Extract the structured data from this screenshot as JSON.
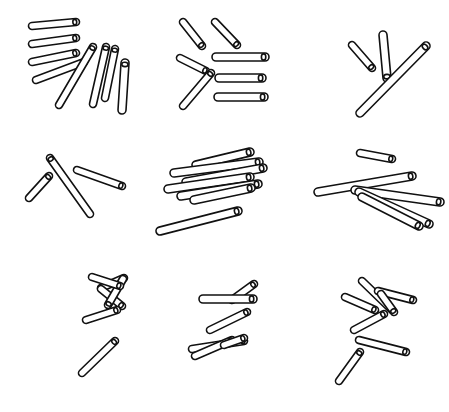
{
  "figure": {
    "width": 449,
    "height": 412,
    "background_color": "#ffffff",
    "stroke_color": "#111111",
    "fill_color": "#ffffff",
    "stroke_width": 1.6,
    "rows": 3,
    "columns": 3,
    "panel_count": 9,
    "panel_width": 149.67,
    "panel_height": 137.33,
    "style": "black outline stick / rod shapes with rounded end caps on plain white background"
  },
  "panels": [
    {
      "id": "panel-1",
      "position": "top-left",
      "row": 1,
      "col": 1,
      "stick_count": 8,
      "description": "Fan of four short near-horizontal sticks upper-left plus four long sticks angled down-right",
      "sticks": [
        {
          "name": "stick-1",
          "x1": 32,
          "y1": 26,
          "x2": 76,
          "y2": 22,
          "w": 7
        },
        {
          "name": "stick-2",
          "x1": 32,
          "y1": 44,
          "x2": 76,
          "y2": 38,
          "w": 7
        },
        {
          "name": "stick-3",
          "x1": 32,
          "y1": 62,
          "x2": 76,
          "y2": 53,
          "w": 7
        },
        {
          "name": "stick-4",
          "x1": 36,
          "y1": 80,
          "x2": 84,
          "y2": 62,
          "w": 7
        },
        {
          "name": "stick-5",
          "x1": 59,
          "y1": 105,
          "x2": 93,
          "y2": 47,
          "w": 7
        },
        {
          "name": "stick-6",
          "x1": 93,
          "y1": 104,
          "x2": 106,
          "y2": 47,
          "w": 7
        },
        {
          "name": "stick-7",
          "x1": 105,
          "y1": 98,
          "x2": 115,
          "y2": 49,
          "w": 7
        },
        {
          "name": "stick-8",
          "x1": 122,
          "y1": 110,
          "x2": 125,
          "y2": 63,
          "w": 8
        }
      ]
    },
    {
      "id": "panel-2",
      "position": "top-center",
      "row": 1,
      "col": 2,
      "stick_count": 7,
      "description": "Four diagonal sticks on the left and three thick horizontal sticks stacked on the right",
      "sticks": [
        {
          "name": "stick-1",
          "x1": 183,
          "y1": 22,
          "x2": 202,
          "y2": 46,
          "w": 7
        },
        {
          "name": "stick-2",
          "x1": 215,
          "y1": 22,
          "x2": 237,
          "y2": 45,
          "w": 7
        },
        {
          "name": "stick-3",
          "x1": 180,
          "y1": 58,
          "x2": 206,
          "y2": 71,
          "w": 7
        },
        {
          "name": "stick-4",
          "x1": 183,
          "y1": 106,
          "x2": 211,
          "y2": 73,
          "w": 7
        },
        {
          "name": "stick-5",
          "x1": 216,
          "y1": 57,
          "x2": 265,
          "y2": 57,
          "w": 8
        },
        {
          "name": "stick-6",
          "x1": 219,
          "y1": 78,
          "x2": 262,
          "y2": 78,
          "w": 8
        },
        {
          "name": "stick-7",
          "x1": 218,
          "y1": 97,
          "x2": 264,
          "y2": 97,
          "w": 8
        }
      ]
    },
    {
      "id": "panel-3",
      "position": "top-right",
      "row": 1,
      "col": 3,
      "stick_count": 3,
      "description": "Short diagonal stick, one steep vertical stick, and a long diagonal stick crossing lower-right",
      "sticks": [
        {
          "name": "stick-1",
          "x1": 352,
          "y1": 45,
          "x2": 372,
          "y2": 68,
          "w": 7
        },
        {
          "name": "stick-2",
          "x1": 383,
          "y1": 35,
          "x2": 387,
          "y2": 78,
          "w": 8
        },
        {
          "name": "stick-3",
          "x1": 360,
          "y1": 113,
          "x2": 426,
          "y2": 46,
          "w": 8
        }
      ]
    },
    {
      "id": "panel-4",
      "position": "middle-left",
      "row": 2,
      "col": 1,
      "stick_count": 3,
      "description": "One short diagonal stick lower-left, one long steep stick in the middle, one long shallow stick upper-right",
      "sticks": [
        {
          "name": "stick-1",
          "x1": 29,
          "y1": 198,
          "x2": 49,
          "y2": 176,
          "w": 7
        },
        {
          "name": "stick-2",
          "x1": 90,
          "y1": 214,
          "x2": 50,
          "y2": 158,
          "w": 7
        },
        {
          "name": "stick-3",
          "x1": 77,
          "y1": 170,
          "x2": 122,
          "y2": 186,
          "w": 7
        }
      ]
    },
    {
      "id": "panel-5",
      "position": "middle-center",
      "row": 2,
      "col": 2,
      "stick_count": 7,
      "description": "Dense overlapping cluster of six sticks plus one long stick below",
      "sticks": [
        {
          "name": "stick-1",
          "x1": 196,
          "y1": 165,
          "x2": 250,
          "y2": 152,
          "w": 8
        },
        {
          "name": "stick-2",
          "x1": 174,
          "y1": 173,
          "x2": 259,
          "y2": 162,
          "w": 8
        },
        {
          "name": "stick-3",
          "x1": 186,
          "y1": 182,
          "x2": 263,
          "y2": 168,
          "w": 8
        },
        {
          "name": "stick-4",
          "x1": 168,
          "y1": 189,
          "x2": 250,
          "y2": 177,
          "w": 8
        },
        {
          "name": "stick-5",
          "x1": 181,
          "y1": 196,
          "x2": 258,
          "y2": 184,
          "w": 8
        },
        {
          "name": "stick-6",
          "x1": 194,
          "y1": 200,
          "x2": 251,
          "y2": 188,
          "w": 8
        },
        {
          "name": "stick-7",
          "x1": 160,
          "y1": 231,
          "x2": 238,
          "y2": 211,
          "w": 8
        }
      ]
    },
    {
      "id": "panel-6",
      "position": "middle-right",
      "row": 2,
      "col": 3,
      "stick_count": 5,
      "description": "One short stick at top, one long shallow stick across the middle, and three sticks fanning to the lower-right",
      "sticks": [
        {
          "name": "stick-1",
          "x1": 360,
          "y1": 153,
          "x2": 392,
          "y2": 159,
          "w": 7
        },
        {
          "name": "stick-2",
          "x1": 318,
          "y1": 192,
          "x2": 412,
          "y2": 176,
          "w": 8
        },
        {
          "name": "stick-3",
          "x1": 355,
          "y1": 190,
          "x2": 440,
          "y2": 202,
          "w": 8
        },
        {
          "name": "stick-4",
          "x1": 359,
          "y1": 192,
          "x2": 429,
          "y2": 224,
          "w": 8
        },
        {
          "name": "stick-5",
          "x1": 362,
          "y1": 197,
          "x2": 419,
          "y2": 226,
          "w": 8
        }
      ]
    },
    {
      "id": "panel-7",
      "position": "bottom-left",
      "row": 3,
      "col": 1,
      "stick_count": 6,
      "description": "Zigzag Z-shaped arrangement of five sticks plus one diagonal stick below",
      "sticks": [
        {
          "name": "stick-1",
          "x1": 101,
          "y1": 288,
          "x2": 124,
          "y2": 278,
          "w": 7
        },
        {
          "name": "stick-2",
          "x1": 101,
          "y1": 289,
          "x2": 122,
          "y2": 306,
          "w": 7
        },
        {
          "name": "stick-3",
          "x1": 123,
          "y1": 279,
          "x2": 108,
          "y2": 305,
          "w": 7
        },
        {
          "name": "stick-4",
          "x1": 86,
          "y1": 320,
          "x2": 117,
          "y2": 310,
          "w": 7
        },
        {
          "name": "stick-5",
          "x1": 82,
          "y1": 373,
          "x2": 115,
          "y2": 341,
          "w": 7
        },
        {
          "name": "stick-6",
          "x1": 92,
          "y1": 277,
          "x2": 120,
          "y2": 286,
          "w": 7
        }
      ]
    },
    {
      "id": "panel-8",
      "position": "bottom-center",
      "row": 3,
      "col": 2,
      "stick_count": 6,
      "description": "Staircase of sticks rising to the right with a crossing pair at the bottom",
      "sticks": [
        {
          "name": "stick-1",
          "x1": 232,
          "y1": 300,
          "x2": 254,
          "y2": 284,
          "w": 7
        },
        {
          "name": "stick-2",
          "x1": 203,
          "y1": 299,
          "x2": 253,
          "y2": 299,
          "w": 8
        },
        {
          "name": "stick-3",
          "x1": 210,
          "y1": 330,
          "x2": 247,
          "y2": 312,
          "w": 7
        },
        {
          "name": "stick-4",
          "x1": 192,
          "y1": 349,
          "x2": 244,
          "y2": 341,
          "w": 7
        },
        {
          "name": "stick-5",
          "x1": 195,
          "y1": 356,
          "x2": 232,
          "y2": 340,
          "w": 7
        },
        {
          "name": "stick-6",
          "x1": 224,
          "y1": 345,
          "x2": 244,
          "y2": 338,
          "w": 7
        }
      ]
    },
    {
      "id": "panel-9",
      "position": "bottom-right",
      "row": 3,
      "col": 3,
      "stick_count": 7,
      "description": "Scatter of seven sticks at varied angles fanning from upper-left to lower-right",
      "sticks": [
        {
          "name": "stick-1",
          "x1": 362,
          "y1": 281,
          "x2": 392,
          "y2": 310,
          "w": 7
        },
        {
          "name": "stick-2",
          "x1": 378,
          "y1": 291,
          "x2": 413,
          "y2": 300,
          "w": 7
        },
        {
          "name": "stick-3",
          "x1": 381,
          "y1": 294,
          "x2": 394,
          "y2": 312,
          "w": 7
        },
        {
          "name": "stick-4",
          "x1": 345,
          "y1": 297,
          "x2": 375,
          "y2": 310,
          "w": 7
        },
        {
          "name": "stick-5",
          "x1": 354,
          "y1": 330,
          "x2": 384,
          "y2": 314,
          "w": 7
        },
        {
          "name": "stick-6",
          "x1": 359,
          "y1": 340,
          "x2": 406,
          "y2": 352,
          "w": 7
        },
        {
          "name": "stick-7",
          "x1": 339,
          "y1": 381,
          "x2": 360,
          "y2": 352,
          "w": 7
        }
      ]
    }
  ]
}
